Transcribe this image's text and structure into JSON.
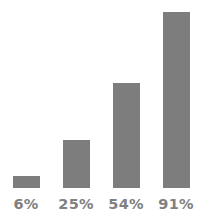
{
  "chart_data": {
    "type": "bar",
    "title": "",
    "subtitle": "",
    "xlabel": "",
    "ylabel": "",
    "categories": [
      "6%",
      "25%",
      "54%",
      "91%"
    ],
    "values": [
      6,
      25,
      54,
      91
    ],
    "value_labels": [
      "6%",
      "25%",
      "54%",
      "91%"
    ],
    "ylim": [
      0,
      97
    ],
    "grid": false,
    "legend": null,
    "legend_position": "none",
    "axes_visible": false,
    "bar_color": "#7d7d7d",
    "label_color": "#808080",
    "background_color": "#ffffff",
    "label_position": "below-bar"
  }
}
